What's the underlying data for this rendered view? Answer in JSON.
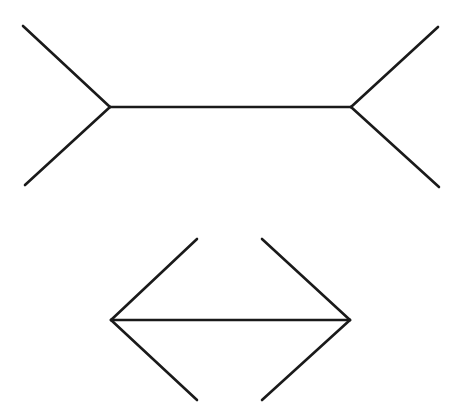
{
  "figure": {
    "name": "Müller-Lyer illusion",
    "stroke_color": "#1a1a1a",
    "background": "#ffffff",
    "figures": [
      {
        "id": "outward-fins",
        "shaft": {
          "x1": 110,
          "y1": 107,
          "x2": 351,
          "y2": 107
        },
        "fins": [
          {
            "x1": 110,
            "y1": 107,
            "x2": 23,
            "y2": 26
          },
          {
            "x1": 110,
            "y1": 107,
            "x2": 25,
            "y2": 185
          },
          {
            "x1": 351,
            "y1": 107,
            "x2": 438,
            "y2": 27
          },
          {
            "x1": 351,
            "y1": 107,
            "x2": 439,
            "y2": 187
          }
        ]
      },
      {
        "id": "inward-fins",
        "shaft": {
          "x1": 111,
          "y1": 320,
          "x2": 350,
          "y2": 320
        },
        "fins": [
          {
            "x1": 111,
            "y1": 320,
            "x2": 197,
            "y2": 239
          },
          {
            "x1": 111,
            "y1": 320,
            "x2": 197,
            "y2": 400
          },
          {
            "x1": 350,
            "y1": 320,
            "x2": 262,
            "y2": 239
          },
          {
            "x1": 350,
            "y1": 320,
            "x2": 262,
            "y2": 400
          }
        ]
      }
    ]
  }
}
